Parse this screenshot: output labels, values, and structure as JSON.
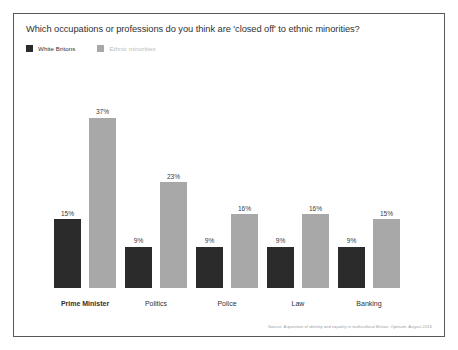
{
  "chart_data": {
    "type": "bar",
    "title": "Which occupations or professions do you think are 'closed off' to ethnic minorities?",
    "xlabel": "",
    "ylabel": "",
    "ylim": [
      0,
      40
    ],
    "grid": false,
    "legend_position": "top-left",
    "value_suffix": "%",
    "categories": [
      "Prime Minister",
      "Politics",
      "Police",
      "Law",
      "Banking"
    ],
    "emphasized_category": "Prime Minister",
    "series": [
      {
        "name": "White Britons",
        "color": "#2b2b2b",
        "values": [
          15,
          9,
          9,
          9,
          9
        ],
        "labels": [
          "15%",
          "9%",
          "9%",
          "9%",
          "9%"
        ]
      },
      {
        "name": "Ethnic minorities",
        "color": "#a8a8a8",
        "values": [
          37,
          23,
          16,
          16,
          15
        ],
        "labels": [
          "37%",
          "23%",
          "16%",
          "16%",
          "15%"
        ]
      }
    ],
    "source": "Source: A question of identity and equality in multicultural Britain, Opinium, August 2016"
  }
}
